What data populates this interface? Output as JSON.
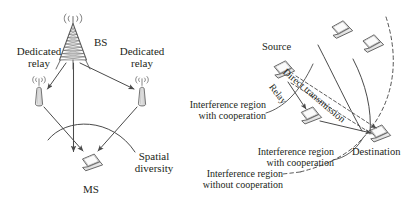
{
  "figure": {
    "type": "diagram",
    "ink_color": "#3b3b3b",
    "text_color": "#231f20",
    "background": "#ffffff"
  },
  "left_panel": {
    "name": "dedicated-relay-diversity",
    "nodes": [
      {
        "id": "bs",
        "icon": "cell-tower-icon",
        "label": "BS"
      },
      {
        "id": "relay-left",
        "icon": "relay-antenna-icon",
        "label": "Dedicated\nrelay",
        "label_line1": "Dedicated",
        "label_line2": "relay"
      },
      {
        "id": "relay-right",
        "icon": "relay-antenna-icon",
        "label_line1": "Dedicated",
        "label_line2": "relay"
      },
      {
        "id": "ms",
        "icon": "laptop-icon",
        "label": "MS"
      }
    ],
    "annotations": [
      {
        "id": "spatial-diversity",
        "line1": "Spatial",
        "line2": "diversity",
        "marker": "arc"
      }
    ],
    "links": [
      {
        "from": "bs",
        "to": "relay-left",
        "style": "solid-arrow"
      },
      {
        "from": "bs",
        "to": "relay-right",
        "style": "solid-arrow"
      },
      {
        "from": "bs",
        "to": "ms",
        "style": "solid-arrow"
      },
      {
        "from": "relay-left",
        "to": "ms",
        "style": "solid-arrow"
      },
      {
        "from": "relay-right",
        "to": "ms",
        "style": "solid-arrow"
      }
    ]
  },
  "right_panel": {
    "name": "interference-regions",
    "nodes": [
      {
        "id": "source",
        "icon": "laptop-icon",
        "label": "Source"
      },
      {
        "id": "relay",
        "icon": "laptop-icon",
        "label": ""
      },
      {
        "id": "destination",
        "icon": "laptop-icon",
        "label": "Destination"
      },
      {
        "id": "other-node-1",
        "icon": "laptop-icon",
        "label": ""
      },
      {
        "id": "other-node-2",
        "icon": "laptop-icon",
        "label": ""
      }
    ],
    "links": [
      {
        "id": "relay-link",
        "label": "Relay",
        "style": "solid-arrow",
        "rotation_deg": 52
      },
      {
        "id": "direct-link",
        "label": "Direct transmission",
        "style": "dashed-double-arrow",
        "rotation_deg": 40
      },
      {
        "id": "relay-to-destination",
        "label": "",
        "style": "solid-arrow"
      }
    ],
    "annotations": [
      {
        "id": "interference-with-cooperation-1",
        "line1": "Interference region",
        "line2": "with cooperation",
        "curve": "solid"
      },
      {
        "id": "interference-with-cooperation-2",
        "line1": "Interference region",
        "line2": "with cooperation",
        "curve": "solid"
      },
      {
        "id": "interference-without-cooperation",
        "line1": "Interference region",
        "line2": "without cooperation",
        "curve": "dashed"
      }
    ]
  }
}
